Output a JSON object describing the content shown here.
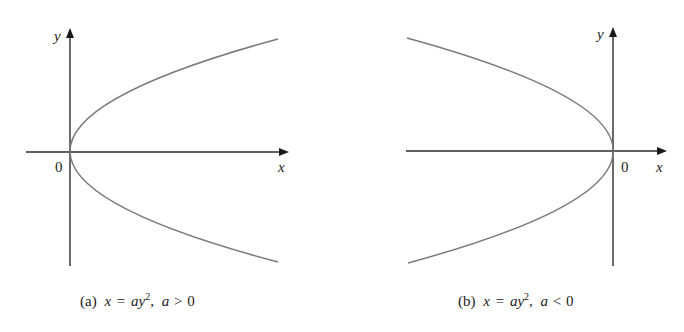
{
  "figures": [
    {
      "id": "a",
      "axis_labels": {
        "x": "x",
        "y": "y",
        "origin": "0"
      },
      "caption": {
        "prefix": "(a)",
        "lhs": "x",
        "eq": "=",
        "rhs_coef": "a",
        "rhs_var": "y",
        "exp": "2",
        "sep": ",",
        "cond_var": "a",
        "cond_op": ">",
        "cond_val": "0"
      },
      "curve": "x = ay^2, a > 0 (parabola opening right)"
    },
    {
      "id": "b",
      "axis_labels": {
        "x": "x",
        "y": "y",
        "origin": "0"
      },
      "caption": {
        "prefix": "(b)",
        "lhs": "x",
        "eq": "=",
        "rhs_coef": "a",
        "rhs_var": "y",
        "exp": "2",
        "sep": ",",
        "cond_var": "a",
        "cond_op": "<",
        "cond_val": "0"
      },
      "curve": "x = ay^2, a < 0 (parabola opening left)"
    }
  ],
  "colors": {
    "axis": "#2a2a2a",
    "curve": "#7a7a7a",
    "text": "#222222"
  }
}
